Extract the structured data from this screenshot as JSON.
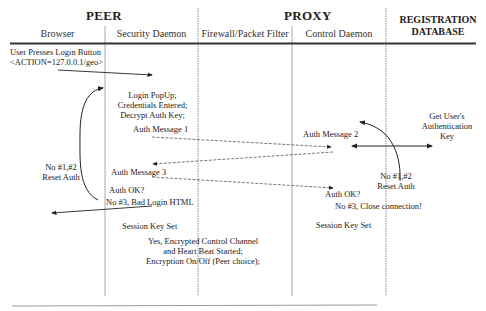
{
  "header": {
    "groups": [
      {
        "id": "peer",
        "label": "PEER"
      },
      {
        "id": "proxy",
        "label": "PROXY"
      },
      {
        "id": "registration",
        "label_line1": "REGISTRATION",
        "label_line2": "DATABASE"
      }
    ],
    "columns": [
      {
        "id": "browser",
        "label": "Browser"
      },
      {
        "id": "security-daemon",
        "label": "Security Daemon"
      },
      {
        "id": "firewall",
        "label": "Firewall/Packet Filter"
      },
      {
        "id": "control-daemon",
        "label": "Control Daemon"
      }
    ]
  },
  "steps": {
    "user_login_line1": "User Presses Login Button",
    "user_login_line2": "<ACTION=127.0.0.1/geo>",
    "login_popup_line1": "Login PopUp;",
    "login_popup_line2": "Credentials Entered;",
    "login_popup_line3": "Decrypt Auth Key;",
    "auth_message_1": "Auth Message 1",
    "auth_message_2": "Auth Message 2",
    "get_key_line1": "Get User's",
    "get_key_line2": "Authentication",
    "get_key_line3": "Key",
    "peer_reset_line1": "No #1,#2",
    "peer_reset_line2": "Reset Auth",
    "auth_message_3": "Auth Message 3",
    "peer_auth_ok": "Auth OK?",
    "peer_bad_login": "No #3, Bad Login HTML",
    "proxy_reset_line1": "No #1,#2",
    "proxy_reset_line2": "Reset Auth",
    "proxy_auth_ok": "Auth OK?",
    "proxy_close": "No #3, Close connection!",
    "peer_session_key": "Session Key Set",
    "proxy_session_key": "Session Key Set",
    "encrypted_line1": "Yes, Encrypted Control Channel",
    "encrypted_line2": "and Heart Beat Started;",
    "encrypted_line3": "Encryption On/Off (Peer choice);"
  },
  "colors": {
    "ink": "#222222",
    "lane_line": "#9a9a9a",
    "header_rule": "#333333"
  }
}
